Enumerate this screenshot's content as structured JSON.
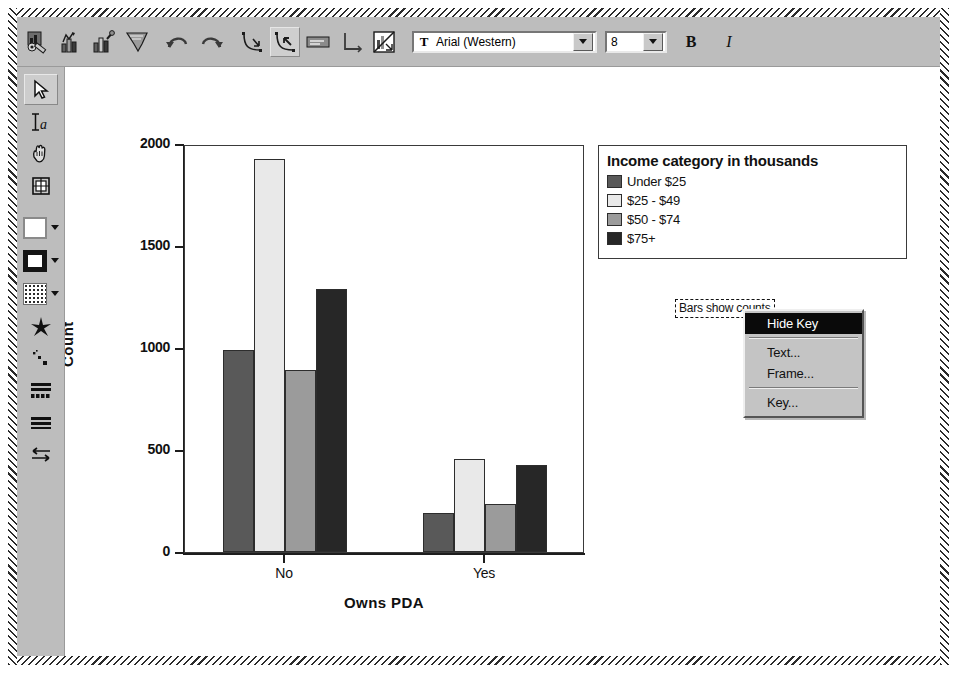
{
  "toolbar": {
    "buttons": [
      {
        "name": "chart-options-icon",
        "title": "Chart options"
      },
      {
        "name": "bar-chart-icon",
        "title": "Bar chart"
      },
      {
        "name": "bar-chart-edit-icon",
        "title": "Edit bar chart"
      },
      {
        "name": "histogram-icon",
        "title": "Histogram"
      },
      {
        "name": "undo-icon",
        "title": "Undo"
      },
      {
        "name": "redo-icon",
        "title": "Redo"
      },
      {
        "name": "axis-tool-icon",
        "title": "Axis"
      },
      {
        "name": "axis-tool-selected-icon",
        "title": "Axis selected"
      },
      {
        "name": "label-icon",
        "title": "Label"
      },
      {
        "name": "axis-corner-icon",
        "title": "Axis corner"
      },
      {
        "name": "chart-transpose-icon",
        "title": "Transpose chart"
      }
    ],
    "font_name": "Arial (Western)",
    "font_size": "8",
    "bold_label": "B",
    "italic_label": "I",
    "font_glyph": "T"
  },
  "left_toolbar": {
    "tools": [
      {
        "name": "select-arrow-tool",
        "selected": true
      },
      {
        "name": "text-tool",
        "selected": false
      },
      {
        "name": "hand-pan-tool",
        "selected": false
      },
      {
        "name": "grid-tool",
        "selected": false
      }
    ],
    "swatches": [
      {
        "name": "fill-color-swatch",
        "color": "#ffffff"
      },
      {
        "name": "border-style-swatch",
        "color": "#1a1a1a"
      },
      {
        "name": "fill-pattern-swatch",
        "color": "#ffffff"
      }
    ],
    "markers": [
      {
        "name": "marker-style-tool"
      },
      {
        "name": "scatter-style-tool"
      },
      {
        "name": "bar-style-tool"
      },
      {
        "name": "line-style-tool"
      },
      {
        "name": "arrow-style-tool"
      }
    ]
  },
  "chart_data": {
    "type": "bar",
    "title": "",
    "xlabel": "Owns PDA",
    "ylabel": "Count",
    "categories": [
      "No",
      "Yes"
    ],
    "ylim": [
      0,
      2000
    ],
    "yticks": [
      0,
      500,
      1000,
      1500,
      2000
    ],
    "ytick_labels": [
      "0",
      "500",
      "1000",
      "1500",
      "2000"
    ],
    "grid": false,
    "legend_position": "right",
    "legend_title": "Income category in thousands",
    "footnote": "Bars show counts",
    "series": [
      {
        "name": "Under $25",
        "color": "#595959",
        "values": [
          990,
          190
        ]
      },
      {
        "name": "$25 - $49",
        "color": "#e9e9e9",
        "values": [
          1925,
          455
        ]
      },
      {
        "name": "$50 - $74",
        "color": "#9b9b9b",
        "values": [
          890,
          235
        ]
      },
      {
        "name": "$75+",
        "color": "#272727",
        "values": [
          1290,
          425
        ]
      }
    ]
  },
  "context_menu": {
    "items": [
      {
        "label": "Hide Key",
        "highlighted": true,
        "separator_after": true
      },
      {
        "label": "Text...",
        "highlighted": false,
        "separator_after": false
      },
      {
        "label": "Frame...",
        "highlighted": false,
        "separator_after": true
      },
      {
        "label": "Key...",
        "highlighted": false,
        "separator_after": false
      }
    ]
  }
}
